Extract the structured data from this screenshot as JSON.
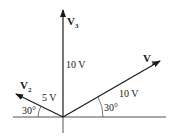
{
  "diagram": {
    "type": "phasor-diagram",
    "vectors": [
      {
        "name": "V",
        "subscript": "1",
        "magnitude_label": "10 V",
        "angle_label": "30°",
        "angle_deg": 30
      },
      {
        "name": "V",
        "subscript": "2",
        "magnitude_label": "5 V",
        "angle_label": "30°",
        "angle_deg": 150
      },
      {
        "name": "V",
        "subscript": "3",
        "magnitude_label": "10 V",
        "angle_deg": 90
      }
    ],
    "colors": {
      "line": "#1a1a1a",
      "axis": "#555555",
      "background": "#ffffff"
    }
  }
}
